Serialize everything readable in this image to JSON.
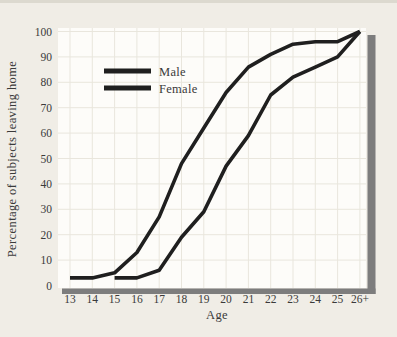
{
  "style": {
    "page_bg": "#f0ede6",
    "plot_bg": "#fdfcf9",
    "grid_color": "#e9e6dd",
    "line_color": "#1f1f1f",
    "shadow_bar_color": "#7d7d7d",
    "text_color": "#3a3a3a"
  },
  "chart_data": {
    "type": "line",
    "title": "",
    "xlabel": "Age",
    "ylabel": "Percentage of subjects leaving home",
    "xlim": [
      13,
      26
    ],
    "ylim": [
      0,
      100
    ],
    "x_ticks": [
      13,
      14,
      15,
      16,
      17,
      18,
      19,
      20,
      21,
      22,
      23,
      24,
      25,
      26
    ],
    "x_tick_labels": [
      "13",
      "14",
      "15",
      "16",
      "17",
      "18",
      "19",
      "20",
      "21",
      "22",
      "23",
      "24",
      "25",
      "26+"
    ],
    "y_ticks": [
      0,
      10,
      20,
      30,
      40,
      50,
      60,
      70,
      80,
      90,
      100
    ],
    "grid": true,
    "legend_position": "upper-left-inside",
    "series": [
      {
        "name": "Male",
        "points": [
          [
            13,
            3
          ],
          [
            14,
            3
          ],
          [
            15,
            5
          ],
          [
            16,
            13
          ],
          [
            17,
            27
          ],
          [
            18,
            48
          ],
          [
            19,
            62
          ],
          [
            20,
            76
          ],
          [
            21,
            86
          ],
          [
            22,
            91
          ],
          [
            23,
            95
          ],
          [
            24,
            96
          ],
          [
            25,
            96
          ],
          [
            26,
            100
          ]
        ]
      },
      {
        "name": "Female",
        "points": [
          [
            15,
            3
          ],
          [
            16,
            3
          ],
          [
            17,
            6
          ],
          [
            18,
            19
          ],
          [
            19,
            29
          ],
          [
            20,
            47
          ],
          [
            21,
            59
          ],
          [
            22,
            75
          ],
          [
            23,
            82
          ],
          [
            24,
            86
          ],
          [
            25,
            90
          ],
          [
            26,
            100
          ]
        ]
      }
    ]
  }
}
